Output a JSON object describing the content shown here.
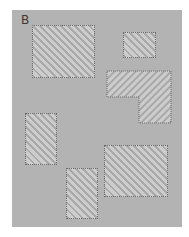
{
  "figure": {
    "panel_label": "B",
    "shapes": [
      {
        "id": "rect-1",
        "kind": "rectangle",
        "fill": "hatched"
      },
      {
        "id": "rect-2",
        "kind": "rectangle",
        "fill": "hatched"
      },
      {
        "id": "l-shape",
        "kind": "l-shaped-polygon",
        "fill": "hatched"
      },
      {
        "id": "rect-3",
        "kind": "rectangle",
        "fill": "hatched"
      },
      {
        "id": "rect-4",
        "kind": "rectangle",
        "fill": "hatched"
      },
      {
        "id": "rect-5",
        "kind": "rectangle",
        "fill": "hatched"
      }
    ],
    "colors": {
      "panel_background": "#b3b3b3",
      "hatch_dark": "#a9a9a9",
      "hatch_light": "#cdcdcd",
      "outline": "#6a6a6a"
    }
  }
}
